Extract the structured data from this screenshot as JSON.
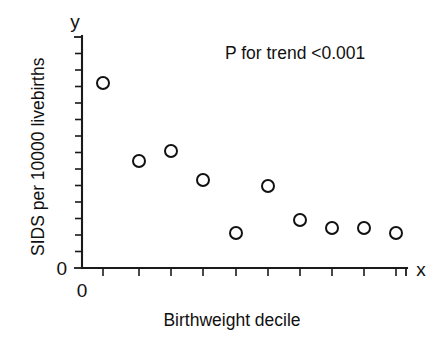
{
  "chart_data": {
    "type": "scatter",
    "title": "",
    "subtitle": "",
    "xlabel": "Birthweight decile",
    "ylabel": "SIDS per 10000 livebirths",
    "x_axis_letter": "x",
    "y_axis_letter": "y",
    "x_origin_label": "0",
    "y_origin_label": "0",
    "annotation": "P for trend <0.001",
    "grid": false,
    "legend": "none",
    "x_tick_labels": [],
    "y_tick_labels": [],
    "xlim": [
      0,
      10.5
    ],
    "ylim": [
      0,
      8
    ],
    "x_tick_count": 10,
    "y_tick_count": 13,
    "categories": [
      1,
      2,
      3,
      4,
      5,
      6,
      7,
      8,
      9,
      10
    ],
    "x": [
      1,
      2,
      3,
      4,
      5,
      6,
      7,
      8,
      9,
      10
    ],
    "values": [
      6.5,
      4.2,
      4.5,
      3.6,
      1.7,
      3.3,
      2.2,
      1.9,
      1.9,
      1.7
    ],
    "series": [
      {
        "name": "SIDS rate by birthweight decile",
        "marker": "open-circle",
        "color": "#111111",
        "values": [
          6.5,
          4.2,
          4.5,
          3.6,
          1.7,
          3.3,
          2.2,
          1.9,
          1.9,
          1.7
        ]
      }
    ],
    "points": [
      {
        "decile": 1,
        "rate": 6.5,
        "px": 103,
        "py": 83
      },
      {
        "decile": 2,
        "rate": 4.2,
        "px": 139,
        "py": 161
      },
      {
        "decile": 3,
        "rate": 4.5,
        "px": 171,
        "py": 151
      },
      {
        "decile": 4,
        "rate": 3.6,
        "px": 203,
        "py": 180
      },
      {
        "decile": 5,
        "rate": 1.7,
        "px": 236,
        "py": 233
      },
      {
        "decile": 6,
        "rate": 3.3,
        "px": 268,
        "py": 186
      },
      {
        "decile": 7,
        "rate": 2.2,
        "px": 300,
        "py": 220
      },
      {
        "decile": 8,
        "rate": 1.9,
        "px": 332,
        "py": 228
      },
      {
        "decile": 9,
        "rate": 1.9,
        "px": 364,
        "py": 228
      },
      {
        "decile": 10,
        "rate": 1.7,
        "px": 396,
        "py": 233
      }
    ]
  }
}
